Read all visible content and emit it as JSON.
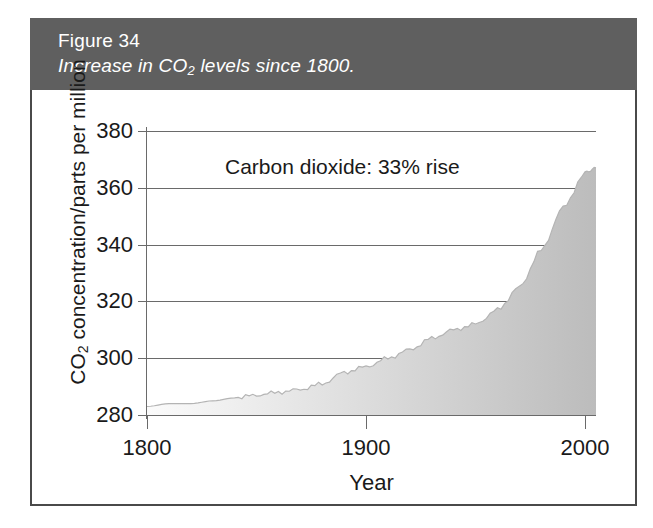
{
  "figure": {
    "number": "Figure 34",
    "caption_prefix": "Increase in CO",
    "caption_sub": "2",
    "caption_suffix": " levels since 1800.",
    "banner_color": "#5f5f5f",
    "panel_border_color": "#4a4a4a"
  },
  "chart_data": {
    "type": "area",
    "title": "",
    "subtitle": "",
    "xlabel": "Year",
    "ylabel_prefix": "CO",
    "ylabel_sub": "2",
    "ylabel_suffix": " concentration/parts per million",
    "ylabel_full": "CO2 concentration/parts per million",
    "annotation": "Carbon dioxide: 33% rise",
    "xlim": [
      1800,
      2005
    ],
    "ylim": [
      280,
      380
    ],
    "xticks": [
      1800,
      1900,
      2000
    ],
    "xtick_labels": [
      "1800",
      "1900",
      "2000"
    ],
    "yticks": [
      280,
      300,
      320,
      340,
      360,
      380
    ],
    "ytick_labels": [
      "280",
      "300",
      "320",
      "340",
      "360",
      "380"
    ],
    "grid": true,
    "grid_axis": "y",
    "legend": false,
    "fill_gradient": [
      "#fbfbfb",
      "#bcbcbc"
    ],
    "line_color": "#b4b4b4",
    "series": [
      {
        "name": "Carbon dioxide concentration",
        "x": [
          1800,
          1810,
          1820,
          1830,
          1840,
          1850,
          1860,
          1870,
          1880,
          1890,
          1900,
          1910,
          1920,
          1930,
          1940,
          1950,
          1960,
          1970,
          1980,
          1990,
          2000,
          2005
        ],
        "values": [
          283,
          284,
          284,
          285,
          286,
          287,
          288,
          289,
          291,
          295,
          297,
          300,
          303,
          307,
          310,
          312,
          317,
          325,
          338,
          353,
          365,
          367
        ]
      }
    ]
  }
}
